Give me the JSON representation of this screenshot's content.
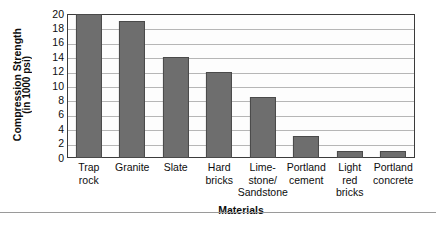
{
  "chart_data": {
    "type": "bar",
    "title": "",
    "xlabel": "Materials",
    "ylabel": "Compression Strength",
    "ylabel_sub": "(in 1000 psi)",
    "ylim": [
      0,
      20
    ],
    "yticks": [
      20,
      18,
      16,
      14,
      12,
      10,
      8,
      6,
      4,
      2,
      0
    ],
    "grid": true,
    "legend": "none",
    "bar_color": "#6e6e6e",
    "bar_edge_color": "#4a4a4a",
    "frame_color": "#3b3b3b",
    "gridline_color": "#b6b6b6",
    "categories": [
      "Trap rock",
      "Granite",
      "Slate",
      "Hard bricks",
      "Lime-stone/ Sandstone",
      "Portland cement",
      "Light red bricks",
      "Portland concrete"
    ],
    "category_lines": [
      [
        "Trap",
        "rock"
      ],
      [
        "Granite"
      ],
      [
        "Slate"
      ],
      [
        "Hard",
        "bricks"
      ],
      [
        "Lime-",
        "stone/",
        "Sandstone"
      ],
      [
        "Portland",
        "cement"
      ],
      [
        "Light",
        "red",
        "bricks"
      ],
      [
        "Portland",
        "concrete"
      ]
    ],
    "values": [
      20,
      19,
      14,
      12,
      8.5,
      3,
      1,
      1
    ]
  }
}
